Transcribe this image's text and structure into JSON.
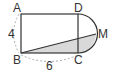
{
  "diagram": {
    "type": "geometry",
    "points": {
      "A": {
        "label": "A"
      },
      "B": {
        "label": "B"
      },
      "C": {
        "label": "C"
      },
      "D": {
        "label": "D"
      },
      "M": {
        "label": "M"
      }
    },
    "measurements": {
      "AB": "4",
      "BC": "6"
    },
    "colors": {
      "stroke": "#333333",
      "shade": "#d9d9d9",
      "dashed": "#999999"
    }
  }
}
